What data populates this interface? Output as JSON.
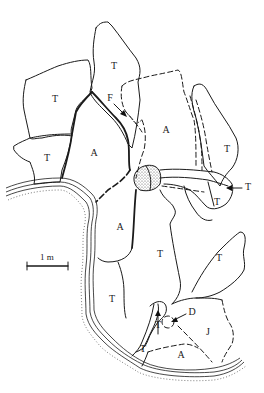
{
  "diagram": {
    "type": "archaeological-site-plan",
    "background": "#ffffff",
    "ink": "#1a1a1a",
    "labels": {
      "t_top": "T",
      "f_label": "F",
      "t_left_upper": "T",
      "a_upper_right": "A",
      "t_left_lower": "T",
      "a_left_mid": "A",
      "t_right_tall": "T",
      "t_right_arrow": "T",
      "t_right_small": "T",
      "a_center": "A",
      "t_center": "T",
      "t_right_lower": "T",
      "t_lower_left": "T",
      "t_inner_small": "T",
      "d_label": "D",
      "j_label": "J",
      "t_bottom": "T",
      "a_bottom": "A"
    },
    "scale_bar": {
      "label": "1 m"
    },
    "legend_semantics": {
      "T": "region type T",
      "A": "region type A",
      "F": "feature F (arrow)",
      "D": "feature D (arrow)",
      "J": "region type J"
    }
  }
}
